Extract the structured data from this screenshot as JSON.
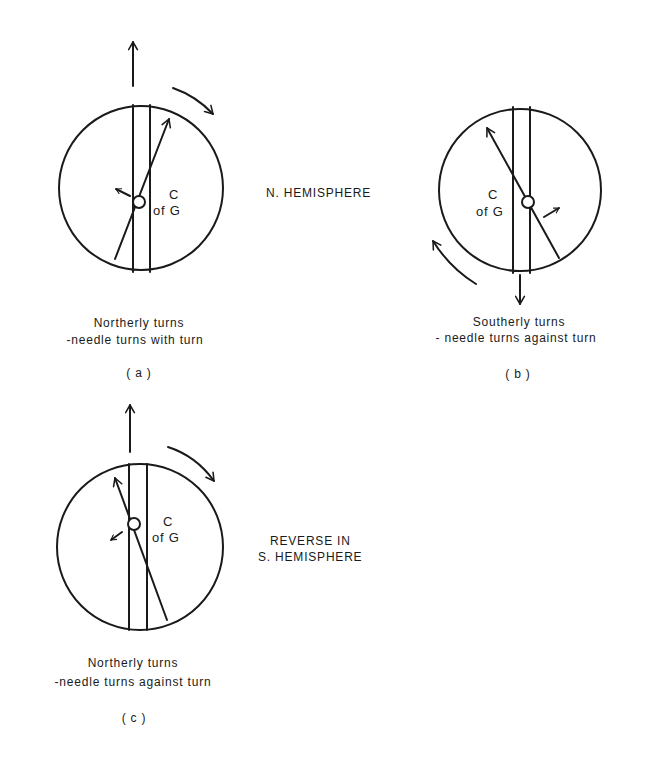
{
  "figure": {
    "center_label": "N. HEMISPHERE",
    "reverse_label_line1": "REVERSE IN",
    "reverse_label_line2": "S. HEMISPHERE"
  },
  "panels": [
    {
      "id": "a",
      "tag": "( a )",
      "caption_line1": "Northerly turns",
      "caption_line2": "-needle turns with turn",
      "cg_label_c": "C",
      "cg_label_of_g": "of G",
      "heading_arrow": "up",
      "turn_arrow": "clockwise"
    },
    {
      "id": "b",
      "tag": "( b )",
      "caption_line1": "Southerly turns",
      "caption_line2": "- needle turns against turn",
      "cg_label_c": "C",
      "cg_label_of_g": "of G",
      "heading_arrow": "down",
      "turn_arrow": "clockwise"
    },
    {
      "id": "c",
      "tag": "( c )",
      "caption_line1": "Northerly turns",
      "caption_line2": "-needle turns against turn",
      "cg_label_c": "C",
      "cg_label_of_g": "of G",
      "heading_arrow": "up",
      "turn_arrow": "clockwise"
    }
  ],
  "colors": {
    "ink": "#1a1a1a",
    "background": "#ffffff"
  }
}
